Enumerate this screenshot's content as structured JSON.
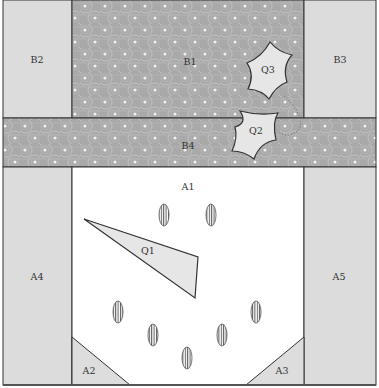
{
  "diagram": {
    "colors": {
      "pattern_base": "#a9a9a9",
      "pattern_ring": "#c4c4c4",
      "pattern_dot": "#eeeeee",
      "side_panel": "#dcdcdc",
      "center_panel": "#ffffff",
      "corner_panel": "#dddddd",
      "piece_fill": "#e6e6e6",
      "stroke": "#333333",
      "dotted": "#555555"
    },
    "regions": {
      "B1": {
        "label": "B1"
      },
      "B2": {
        "label": "B2"
      },
      "B3": {
        "label": "B3"
      },
      "B4": {
        "label": "B4"
      },
      "A1": {
        "label": "A1"
      },
      "A2": {
        "label": "A2"
      },
      "A3": {
        "label": "A3"
      },
      "A4": {
        "label": "A4"
      },
      "A5": {
        "label": "A5"
      }
    },
    "pieces": {
      "Q1": {
        "label": "Q1"
      },
      "Q2": {
        "label": "Q2"
      },
      "Q3": {
        "label": "Q3"
      }
    },
    "ellipse_count": 7
  }
}
